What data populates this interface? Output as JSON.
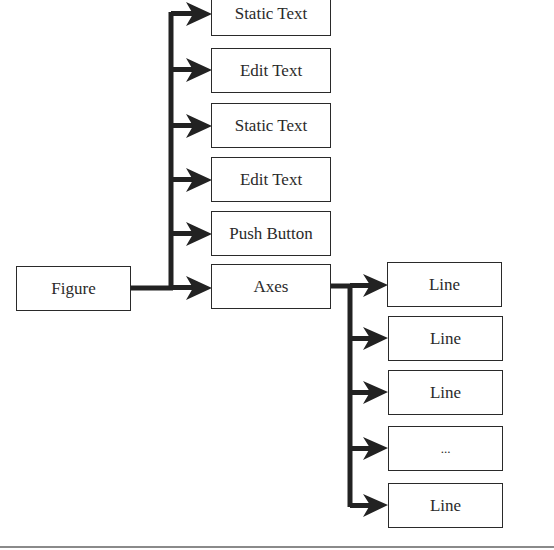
{
  "diagram": {
    "type": "hierarchy-tree",
    "root": {
      "label": "Figure"
    },
    "figure_children": [
      {
        "label": "Static Text"
      },
      {
        "label": "Edit Text"
      },
      {
        "label": "Static Text"
      },
      {
        "label": "Edit Text"
      },
      {
        "label": "Push Button"
      },
      {
        "label": "Axes"
      }
    ],
    "axes_children": [
      {
        "label": "Line"
      },
      {
        "label": "Line"
      },
      {
        "label": "Line"
      },
      {
        "label": "..."
      },
      {
        "label": "Line"
      }
    ],
    "colors": {
      "stroke": "#2a2a2a",
      "background": "#ffffff",
      "divider": "#8a8a8a"
    }
  }
}
